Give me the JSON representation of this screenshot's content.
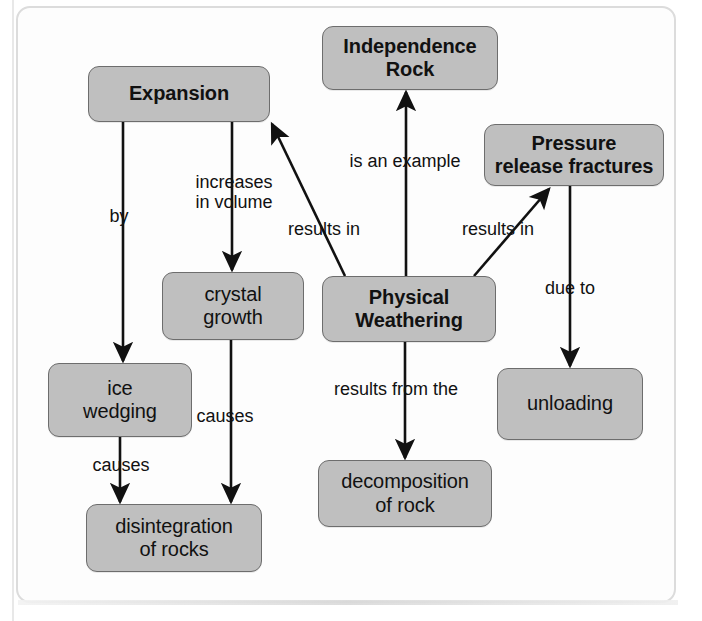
{
  "diagram": {
    "colors": {
      "node_fill": "#bfbfbf",
      "node_stroke": "#6d6d6d",
      "edge_stroke": "#111111",
      "page_background": "#ffffff",
      "frame_stroke": "#dcdcdc"
    },
    "nodes": [
      {
        "id": "expansion",
        "label": "Expansion",
        "bold": true,
        "x": 88,
        "y": 66,
        "w": 182,
        "h": 56
      },
      {
        "id": "independence",
        "label": "Independence\nRock",
        "bold": true,
        "x": 322,
        "y": 26,
        "w": 176,
        "h": 64
      },
      {
        "id": "pressure",
        "label": "Pressure\nrelease fractures",
        "bold": true,
        "x": 484,
        "y": 124,
        "w": 180,
        "h": 62
      },
      {
        "id": "crystal",
        "label": "crystal\ngrowth",
        "bold": false,
        "x": 162,
        "y": 272,
        "w": 142,
        "h": 68
      },
      {
        "id": "physical",
        "label": "Physical\nWeathering",
        "bold": true,
        "x": 322,
        "y": 276,
        "w": 174,
        "h": 66
      },
      {
        "id": "ice",
        "label": "ice\nwedging",
        "bold": false,
        "x": 48,
        "y": 363,
        "w": 144,
        "h": 74
      },
      {
        "id": "unloading",
        "label": "unloading",
        "bold": false,
        "x": 497,
        "y": 368,
        "w": 146,
        "h": 72
      },
      {
        "id": "decomposition",
        "label": "decomposition\nof rock",
        "bold": false,
        "x": 318,
        "y": 460,
        "w": 174,
        "h": 67
      },
      {
        "id": "disintegration",
        "label": "disintegration\nof rocks",
        "bold": false,
        "x": 86,
        "y": 504,
        "w": 176,
        "h": 68
      }
    ],
    "edges": [
      {
        "id": "expansion-by-ice",
        "from": "expansion",
        "to": "ice",
        "label": "by"
      },
      {
        "id": "expansion-increases-crystal",
        "from": "expansion",
        "to": "crystal",
        "label": "increases\nin volume"
      },
      {
        "id": "physical-results-in-expansion",
        "from": "physical",
        "to": "expansion",
        "label": "results in"
      },
      {
        "id": "physical-is-an-example-rock",
        "from": "physical",
        "to": "independence",
        "label": "is an example"
      },
      {
        "id": "physical-results-in-pressure",
        "from": "physical",
        "to": "pressure",
        "label": "results in"
      },
      {
        "id": "physical-results-from-decomp",
        "from": "physical",
        "to": "decomposition",
        "label": "results from the"
      },
      {
        "id": "pressure-due-to-unloading",
        "from": "pressure",
        "to": "unloading",
        "label": "due to"
      },
      {
        "id": "ice-causes-disintegration",
        "from": "ice",
        "to": "disintegration",
        "label": "causes"
      },
      {
        "id": "crystal-causes-disintegration",
        "from": "crystal",
        "to": "disintegration",
        "label": "causes"
      }
    ],
    "edge_labels": {
      "by": "by",
      "increases_in_volume": "increases\nin volume",
      "results_in_expansion": "results in",
      "is_an_example": "is an example",
      "results_in_pressure": "results in",
      "results_from_the": "results from the",
      "due_to": "due to",
      "causes_ice": "causes",
      "causes_crystal": "causes"
    }
  }
}
